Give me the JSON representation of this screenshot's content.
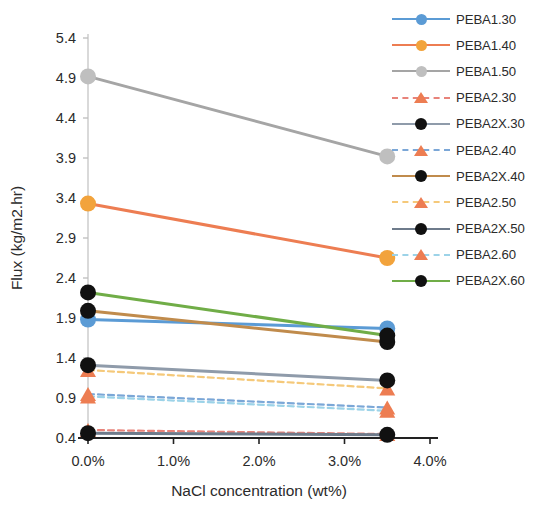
{
  "chart_data": {
    "type": "line",
    "title": "",
    "xlabel": "NaCl concentration (wt%)",
    "ylabel": "Flux (kg/m2.hr)",
    "x": [
      0.0,
      3.5
    ],
    "xlim": [
      0.0,
      4.0
    ],
    "ylim": [
      0.4,
      5.4
    ],
    "xticklabels": [
      "0.0%",
      "1.0%",
      "2.0%",
      "3.0%",
      "4.0%"
    ],
    "xtickvalues": [
      0.0,
      1.0,
      2.0,
      3.0,
      4.0
    ],
    "yticklabels": [
      "0.4",
      "0.9",
      "1.4",
      "1.9",
      "2.4",
      "2.9",
      "3.4",
      "3.9",
      "4.4",
      "4.9",
      "5.4"
    ],
    "ytickvalues": [
      0.4,
      0.9,
      1.4,
      1.9,
      2.4,
      2.9,
      3.4,
      3.9,
      4.4,
      4.9,
      5.4
    ],
    "grid": false,
    "legend_position": "right",
    "series": [
      {
        "name": "PEBA1.30",
        "values": [
          1.88,
          1.77
        ],
        "color": "#5B9BD5",
        "style": "solid",
        "marker": "circle",
        "marker_color": "#5B9BD5"
      },
      {
        "name": "PEBA1.40",
        "values": [
          3.33,
          2.65
        ],
        "color": "#ED7D52",
        "style": "solid",
        "marker": "circle",
        "marker_color": "#F2A33C"
      },
      {
        "name": "PEBA1.50",
        "values": [
          4.92,
          3.92
        ],
        "color": "#A5A5A5",
        "style": "solid",
        "marker": "circle",
        "marker_color": "#BFBFBF"
      },
      {
        "name": "PEBA2.30",
        "values": [
          0.5,
          0.45
        ],
        "color": "#E8837A",
        "style": "dashed",
        "marker": "triangle",
        "marker_color": "#ED7D52"
      },
      {
        "name": "PEBA2X.30",
        "values": [
          1.31,
          1.12
        ],
        "color": "#8F9BAA",
        "style": "solid",
        "marker": "circle",
        "marker_color": "#111111"
      },
      {
        "name": "PEBA2.40",
        "values": [
          0.95,
          0.78
        ],
        "color": "#7BA7D7",
        "style": "dashed",
        "marker": "triangle",
        "marker_color": "#ED7D52"
      },
      {
        "name": "PEBA2X.40",
        "values": [
          1.99,
          1.6
        ],
        "color": "#C08B4C",
        "style": "solid",
        "marker": "circle",
        "marker_color": "#111111"
      },
      {
        "name": "PEBA2.50",
        "values": [
          1.25,
          1.02
        ],
        "color": "#F5C97A",
        "style": "dashed",
        "marker": "triangle",
        "marker_color": "#ED7D52"
      },
      {
        "name": "PEBA2X.50",
        "values": [
          0.46,
          0.44
        ],
        "color": "#6E7B8B",
        "style": "solid",
        "marker": "circle",
        "marker_color": "#111111"
      },
      {
        "name": "PEBA2.60",
        "values": [
          0.92,
          0.74
        ],
        "color": "#9CD3E8",
        "style": "dashed",
        "marker": "triangle",
        "marker_color": "#ED7D52"
      },
      {
        "name": "PEBA2X.60",
        "values": [
          2.22,
          1.68
        ],
        "color": "#70AD47",
        "style": "solid",
        "marker": "circle",
        "marker_color": "#111111"
      }
    ]
  },
  "legend": {
    "items": [
      {
        "label": "PEBA1.30"
      },
      {
        "label": "PEBA1.40"
      },
      {
        "label": "PEBA1.50"
      },
      {
        "label": "PEBA2.30"
      },
      {
        "label": "PEBA2X.30"
      },
      {
        "label": "PEBA2.40"
      },
      {
        "label": "PEBA2X.40"
      },
      {
        "label": "PEBA2.50"
      },
      {
        "label": "PEBA2X.50"
      },
      {
        "label": "PEBA2.60"
      },
      {
        "label": "PEBA2X.60"
      }
    ]
  }
}
